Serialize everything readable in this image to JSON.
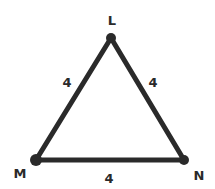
{
  "diagram": {
    "type": "triangle",
    "vertices": [
      {
        "label": "L",
        "x": 111,
        "y": 38,
        "label_x": 112,
        "label_y": 24
      },
      {
        "label": "M",
        "x": 36,
        "y": 160,
        "label_x": 19,
        "label_y": 178
      },
      {
        "label": "N",
        "x": 184,
        "y": 160,
        "label_x": 200,
        "label_y": 180
      }
    ],
    "sides": [
      {
        "between": "L-M",
        "length": "4",
        "label_x": 67,
        "label_y": 86
      },
      {
        "between": "L-N",
        "length": "4",
        "label_x": 153,
        "label_y": 86
      },
      {
        "between": "M-N",
        "length": "4",
        "label_x": 109,
        "label_y": 182
      }
    ],
    "colors": {
      "stroke": "#2a2a2a",
      "background": "#ffffff"
    }
  }
}
